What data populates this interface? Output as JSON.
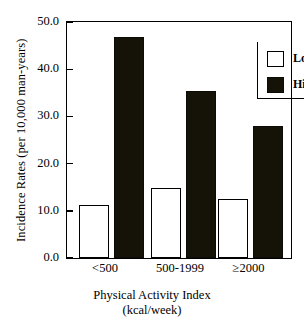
{
  "chart_data": {
    "type": "bar",
    "title": "",
    "categories": [
      "<500",
      "500-1999",
      "≥2000"
    ],
    "series": [
      {
        "name": "Low Risk",
        "values": [
          11.2,
          14.9,
          12.4
        ],
        "color": "#ffffff"
      },
      {
        "name": "High Risk",
        "values": [
          46.8,
          35.4,
          27.9
        ],
        "color": "#151208"
      }
    ],
    "xlabel": "Physical Activity Index",
    "xlabel_line2": "(kcal/week)",
    "ylabel": "Incidence Rates (per 10,000 man-years)",
    "ylim": [
      0.0,
      50.0
    ],
    "yticks": [
      "0.0",
      "10.0",
      "20.0",
      "30.0",
      "40.0",
      "50.0"
    ],
    "ytick_values": [
      0.0,
      10.0,
      20.0,
      30.0,
      40.0,
      50.0
    ],
    "grid": false,
    "legend_position": "top-right",
    "legend_entries": [
      "Low Risk",
      "High Risk"
    ]
  },
  "axis": {
    "y_title": "Incidence Rates (per 10,000 man-years)",
    "x_title_line1": "Physical Activity Index",
    "x_title_line2": "(kcal/week)"
  },
  "legend": {
    "low_label": "Low Risk",
    "high_label": "High Risk"
  },
  "yticks": {
    "t0": "0.0",
    "t1": "10.0",
    "t2": "20.0",
    "t3": "30.0",
    "t4": "40.0",
    "t5": "50.0"
  },
  "xticks": {
    "c0": "<500",
    "c1": "500-1999",
    "c2": "≥2000"
  }
}
